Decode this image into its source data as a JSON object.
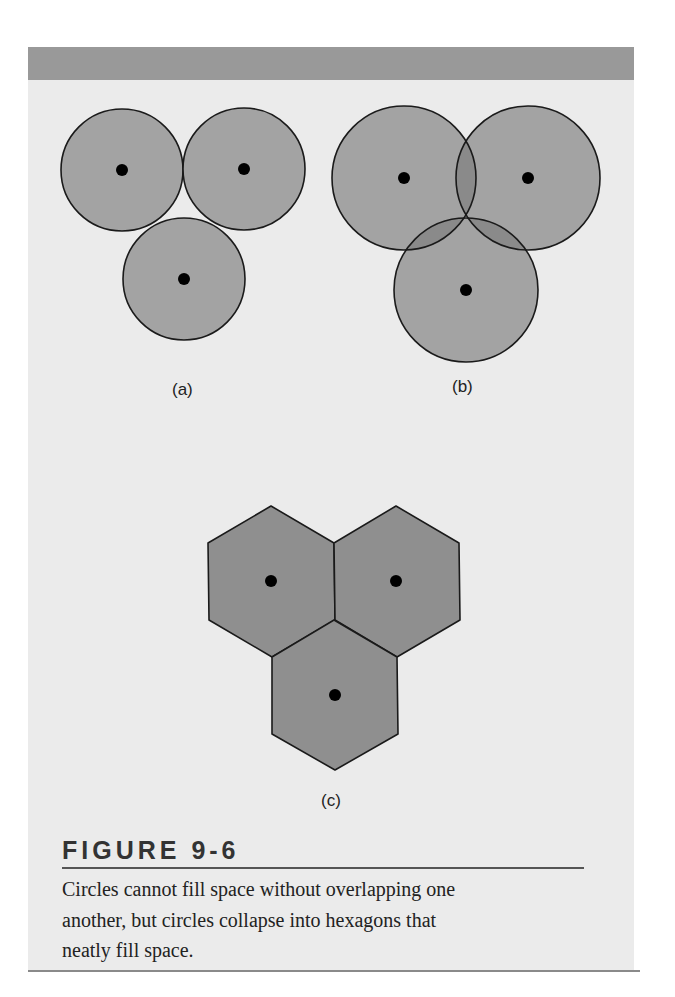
{
  "figure": {
    "number_label": "FIGURE 9-6",
    "caption": "Circles cannot fill space without overlapping one another, but circles collapse into hexagons that neatly fill space.",
    "caption_lines": [
      "Circles cannot fill space without overlapping one",
      "another, but circles collapse into hexagons that",
      "neatly fill space."
    ]
  },
  "panels": {
    "a": {
      "label": "(a)",
      "shape": "circle",
      "arrangement": "tangent",
      "centers": [
        [
          122,
          170
        ],
        [
          244,
          169
        ],
        [
          184,
          279
        ]
      ],
      "radius": 61
    },
    "b": {
      "label": "(b)",
      "shape": "circle",
      "arrangement": "overlapping",
      "centers": [
        [
          404,
          178
        ],
        [
          528,
          178
        ],
        [
          466,
          290
        ]
      ],
      "radius": 72
    },
    "c": {
      "label": "(c)",
      "shape": "hexagon",
      "arrangement": "tiled",
      "centers": [
        [
          271,
          581
        ],
        [
          396,
          581
        ],
        [
          335,
          695
        ]
      ]
    }
  },
  "colors": {
    "top_bar": "#999999",
    "panel_bg": "#ebebeb",
    "circle_fill": "#a3a3a3",
    "overlap_fill": "#8a8a8a",
    "hex_fill": "#8f8f8f",
    "stroke": "#1a1a1a",
    "dot": "#000000"
  }
}
